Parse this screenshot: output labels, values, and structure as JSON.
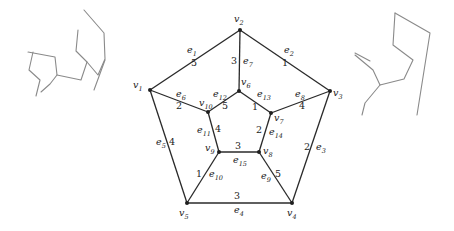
{
  "figure": {
    "type": "weighted-graph",
    "vertices": [
      {
        "id": "v1",
        "label": "v",
        "sub": "1",
        "x": 150,
        "y": 90,
        "lx": 133,
        "ly": 88
      },
      {
        "id": "v2",
        "label": "v",
        "sub": "2",
        "x": 240,
        "y": 30,
        "lx": 234,
        "ly": 22
      },
      {
        "id": "v3",
        "label": "v",
        "sub": "3",
        "x": 330,
        "y": 91,
        "lx": 333,
        "ly": 96
      },
      {
        "id": "v4",
        "label": "v",
        "sub": "4",
        "x": 292,
        "y": 203,
        "lx": 287,
        "ly": 216
      },
      {
        "id": "v5",
        "label": "v",
        "sub": "5",
        "x": 187,
        "y": 203,
        "lx": 179,
        "ly": 216
      },
      {
        "id": "v6",
        "label": "v",
        "sub": "6",
        "x": 239,
        "y": 91,
        "lx": 241,
        "ly": 85
      },
      {
        "id": "v7",
        "label": "v",
        "sub": "7",
        "x": 271,
        "y": 113,
        "lx": 274,
        "ly": 121
      },
      {
        "id": "v8",
        "label": "v",
        "sub": "8",
        "x": 259,
        "y": 152,
        "lx": 263,
        "ly": 154
      },
      {
        "id": "v9",
        "label": "v",
        "sub": "9",
        "x": 219,
        "y": 152,
        "lx": 205,
        "ly": 151
      },
      {
        "id": "v10",
        "label": "v",
        "sub": "10",
        "x": 208,
        "y": 112,
        "lx": 199,
        "ly": 106
      }
    ],
    "edges": [
      {
        "id": "e1",
        "from": "v1",
        "to": "v2",
        "label": "e",
        "sub": "1",
        "weight": "5",
        "lx": 187,
        "ly": 53,
        "wx": 191,
        "wy": 66
      },
      {
        "id": "e2",
        "from": "v2",
        "to": "v3",
        "label": "e",
        "sub": "2",
        "weight": "1",
        "lx": 284,
        "ly": 53,
        "wx": 282,
        "wy": 66
      },
      {
        "id": "e3",
        "from": "v3",
        "to": "v4",
        "label": "e",
        "sub": "3",
        "weight": "2",
        "lx": 316,
        "ly": 150,
        "wx": 304,
        "wy": 150
      },
      {
        "id": "e4",
        "from": "v5",
        "to": "v4",
        "label": "e",
        "sub": "4",
        "weight": "3",
        "lx": 234,
        "ly": 213,
        "wx": 234,
        "wy": 199
      },
      {
        "id": "e5",
        "from": "v1",
        "to": "v5",
        "label": "e",
        "sub": "5",
        "weight": "4",
        "lx": 156,
        "ly": 145,
        "wx": 169,
        "wy": 145
      },
      {
        "id": "e6",
        "from": "v1",
        "to": "v10",
        "label": "e",
        "sub": "6",
        "weight": "2",
        "lx": 176,
        "ly": 97,
        "wx": 176,
        "wy": 109
      },
      {
        "id": "e7",
        "from": "v2",
        "to": "v6",
        "label": "e",
        "sub": "7",
        "weight": "3",
        "lx": 243,
        "ly": 64,
        "wx": 231,
        "wy": 64
      },
      {
        "id": "e8",
        "from": "v7",
        "to": "v3",
        "label": "e",
        "sub": "8",
        "weight": "4",
        "lx": 295,
        "ly": 97,
        "wx": 299,
        "wy": 109
      },
      {
        "id": "e9",
        "from": "v8",
        "to": "v4",
        "label": "e",
        "sub": "9",
        "weight": "5",
        "lx": 261,
        "ly": 179,
        "wx": 275,
        "wy": 177
      },
      {
        "id": "e10",
        "from": "v9",
        "to": "v5",
        "label": "e",
        "sub": "10",
        "weight": "1",
        "lx": 209,
        "ly": 177,
        "wx": 196,
        "wy": 177
      },
      {
        "id": "e11",
        "from": "v10",
        "to": "v9",
        "label": "e",
        "sub": "11",
        "weight": "4",
        "lx": 197,
        "ly": 133,
        "wx": 215,
        "wy": 132
      },
      {
        "id": "e12",
        "from": "v6",
        "to": "v10",
        "label": "e",
        "sub": "12",
        "weight": "5",
        "lx": 213,
        "ly": 97,
        "wx": 222,
        "wy": 109
      },
      {
        "id": "e13",
        "from": "v6",
        "to": "v7",
        "label": "e",
        "sub": "13",
        "weight": "1",
        "lx": 257,
        "ly": 97,
        "wx": 252,
        "wy": 110
      },
      {
        "id": "e14",
        "from": "v7",
        "to": "v8",
        "label": "e",
        "sub": "14",
        "weight": "2",
        "lx": 269,
        "ly": 135,
        "wx": 256,
        "wy": 133
      },
      {
        "id": "e15",
        "from": "v9",
        "to": "v8",
        "label": "e",
        "sub": "15",
        "weight": "3",
        "lx": 233,
        "ly": 163,
        "wx": 235,
        "wy": 149
      }
    ]
  },
  "sketches": {
    "left": "pencil scribble top-left",
    "right": "pencil scribble top-right"
  }
}
